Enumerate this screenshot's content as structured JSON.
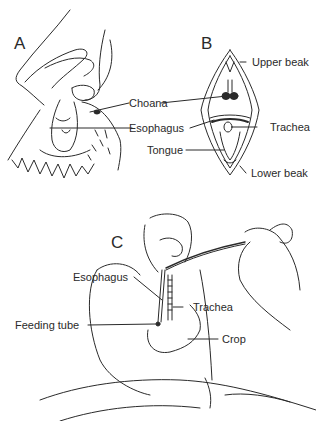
{
  "panels": {
    "a": {
      "letter": "A"
    },
    "b": {
      "letter": "B"
    },
    "c": {
      "letter": "C"
    }
  },
  "labels_ab": {
    "choana": "Choana",
    "esophagus": "Esophagus",
    "tongue": "Tongue",
    "upper_beak": "Upper beak",
    "trachea": "Trachea",
    "lower_beak": "Lower beak"
  },
  "labels_c": {
    "esophagus": "Esophagus",
    "trachea": "Trachea",
    "feeding_tube": "Feeding tube",
    "crop": "Crop"
  },
  "colors": {
    "ink": "#2a2a2a",
    "background": "#ffffff"
  }
}
